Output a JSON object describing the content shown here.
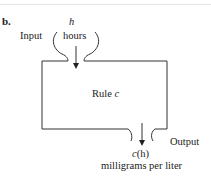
{
  "figure": {
    "part_label": "b.",
    "input": {
      "label": "Input",
      "variable": "h",
      "unit": "hours"
    },
    "rule": {
      "prefix": "Rule",
      "name": "c"
    },
    "output": {
      "label": "Output",
      "expression_fn": "c",
      "expression_arg": "(h)",
      "unit": "milligrams per liter"
    },
    "colors": {
      "stroke": "#333333",
      "text": "#222222"
    }
  }
}
